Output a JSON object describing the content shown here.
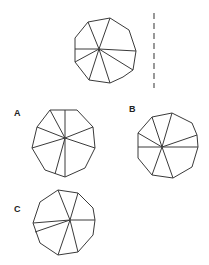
{
  "figure": {
    "colors": {
      "stroke": "#3a3a3a",
      "axis": "#555555",
      "label": "#222222",
      "background": "#ffffff"
    },
    "mirror_line": {
      "x": 154,
      "y1": 13,
      "y2": 88
    },
    "original": {
      "center": [
        99,
        49
      ],
      "vertices": [
        [
          88,
          22
        ],
        [
          110,
          18
        ],
        [
          129,
          30
        ],
        [
          136,
          51
        ],
        [
          133,
          70
        ],
        [
          123,
          77
        ],
        [
          110,
          83
        ],
        [
          89,
          80
        ],
        [
          75,
          62
        ],
        [
          75,
          38
        ]
      ],
      "spoke_ends": [
        [
          88,
          22
        ],
        [
          110,
          18
        ],
        [
          136,
          51
        ],
        [
          133,
          70
        ],
        [
          110,
          83
        ],
        [
          89,
          80
        ],
        [
          75,
          62
        ],
        [
          75,
          49
        ]
      ]
    },
    "options": [
      {
        "label": "A",
        "label_pos": [
          14,
          116
        ],
        "center": [
          65,
          138
        ],
        "vertices": [
          [
            50,
            110
          ],
          [
            77,
            110
          ],
          [
            93,
            127
          ],
          [
            95,
            148
          ],
          [
            85,
            168
          ],
          [
            65,
            177
          ],
          [
            45,
            170
          ],
          [
            32,
            148
          ],
          [
            37,
            127
          ]
        ],
        "spoke_ends": [
          [
            50,
            110
          ],
          [
            65,
            110
          ],
          [
            93,
            127
          ],
          [
            95,
            148
          ],
          [
            65,
            177
          ],
          [
            55,
            174
          ],
          [
            32,
            148
          ],
          [
            37,
            127
          ]
        ]
      },
      {
        "label": "B",
        "label_pos": [
          129,
          112
        ],
        "center": [
          162,
          147
        ],
        "vertices": [
          [
            152,
            117
          ],
          [
            172,
            113
          ],
          [
            192,
            123
          ],
          [
            197,
            135
          ],
          [
            198,
            147
          ],
          [
            192,
            167
          ],
          [
            173,
            178
          ],
          [
            152,
            175
          ],
          [
            138,
            158
          ],
          [
            138,
            133
          ]
        ],
        "spoke_ends": [
          [
            152,
            117
          ],
          [
            172,
            113
          ],
          [
            197,
            135
          ],
          [
            198,
            147
          ],
          [
            173,
            178
          ],
          [
            152,
            175
          ],
          [
            138,
            147
          ],
          [
            138,
            133
          ]
        ]
      },
      {
        "label": "C",
        "label_pos": [
          14,
          212
        ],
        "center": [
          70,
          220
        ],
        "vertices": [
          [
            58,
            190
          ],
          [
            78,
            193
          ],
          [
            93,
            208
          ],
          [
            95,
            220
          ],
          [
            93,
            235
          ],
          [
            78,
            252
          ],
          [
            58,
            255
          ],
          [
            40,
            243
          ],
          [
            33,
            223
          ],
          [
            40,
            202
          ]
        ],
        "spoke_ends": [
          [
            58,
            190
          ],
          [
            78,
            193
          ],
          [
            95,
            220
          ],
          [
            78,
            252
          ],
          [
            58,
            255
          ],
          [
            33,
            223
          ],
          [
            35,
            232
          ]
        ]
      }
    ]
  }
}
